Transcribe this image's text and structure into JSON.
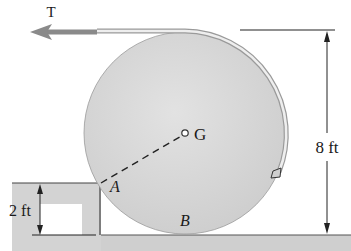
{
  "diagram": {
    "type": "mechanics-free-body-setup",
    "labels": {
      "tension": "T",
      "center": "G",
      "step_contact": "A",
      "ground_contact": "B",
      "cable_anchor": "D"
    },
    "dimensions": {
      "diameter": "8 ft",
      "step_height": "2 ft"
    },
    "colors": {
      "disk_fill": "#d6d6d6",
      "ground_fill": "#cfcfcf",
      "arrow": "#8a8a8a",
      "cable": "#bdbdbd",
      "line": "#222222"
    }
  }
}
